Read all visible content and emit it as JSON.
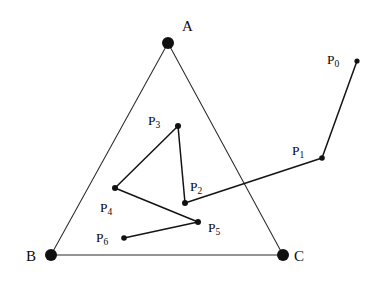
{
  "figure": {
    "background_color": "#ffffff",
    "stroke_color": "#2b2b2b",
    "path_color": "#141414",
    "dot_color": "#111111",
    "width": 390,
    "height": 284
  },
  "triangle": {
    "name": "triangle-ABC",
    "vertices": [
      {
        "id": "A",
        "label": "A",
        "x": 168,
        "y": 43,
        "radius": 6.0,
        "label_x": 182,
        "label_y": 31
      },
      {
        "id": "B",
        "label": "B",
        "x": 51,
        "y": 255,
        "radius": 6.0,
        "label_x": 26,
        "label_y": 261
      },
      {
        "id": "C",
        "label": "C",
        "x": 283,
        "y": 255,
        "radius": 6.0,
        "label_x": 294,
        "label_y": 261
      }
    ],
    "edges": [
      {
        "name": "edge-AB",
        "from": "A",
        "to": "B"
      },
      {
        "name": "edge-AC",
        "from": "A",
        "to": "C"
      },
      {
        "name": "edge-BC",
        "from": "B",
        "to": "C"
      }
    ]
  },
  "points": [
    {
      "id": "P0",
      "label": "P",
      "sub": "0",
      "x": 357,
      "y": 61,
      "radius": 2.6,
      "label_x": 327,
      "label_y": 64
    },
    {
      "id": "P1",
      "label": "P",
      "sub": "1",
      "x": 322,
      "y": 158,
      "radius": 2.8,
      "label_x": 292,
      "label_y": 155
    },
    {
      "id": "P2",
      "label": "P",
      "sub": "2",
      "x": 185,
      "y": 203,
      "radius": 3.0,
      "label_x": 190,
      "label_y": 191
    },
    {
      "id": "P3",
      "label": "P",
      "sub": "3",
      "x": 178,
      "y": 126,
      "radius": 3.0,
      "label_x": 148,
      "label_y": 125
    },
    {
      "id": "P4",
      "label": "P",
      "sub": "4",
      "x": 115,
      "y": 188,
      "radius": 3.0,
      "label_x": 100,
      "label_y": 212
    },
    {
      "id": "P5",
      "label": "P",
      "sub": "5",
      "x": 198,
      "y": 222,
      "radius": 3.0,
      "label_x": 208,
      "label_y": 232
    },
    {
      "id": "P6",
      "label": "P",
      "sub": "6",
      "x": 124,
      "y": 238,
      "radius": 2.8,
      "label_x": 96,
      "label_y": 242
    }
  ],
  "polyline": {
    "name": "point-path",
    "segments": [
      {
        "name": "segment-P0-P1",
        "from": "P0",
        "to": "P1"
      },
      {
        "name": "segment-P1-P2",
        "from": "P1",
        "to": "P2"
      },
      {
        "name": "segment-P2-P3",
        "from": "P2",
        "to": "P3"
      },
      {
        "name": "segment-P3-P4",
        "from": "P3",
        "to": "P4"
      },
      {
        "name": "segment-P4-P5",
        "from": "P4",
        "to": "P5"
      },
      {
        "name": "segment-P5-P6",
        "from": "P5",
        "to": "P6"
      }
    ]
  }
}
